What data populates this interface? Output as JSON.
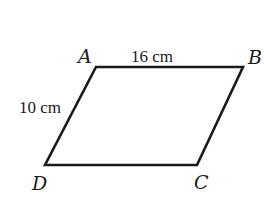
{
  "diagram": {
    "type": "parallelogram",
    "stroke_color": "#1a1a1a",
    "vertices": [
      {
        "name": "A",
        "x": 96,
        "y": 67,
        "label_x": 78,
        "label_y": 63
      },
      {
        "name": "B",
        "x": 243,
        "y": 67,
        "label_x": 248,
        "label_y": 64
      },
      {
        "name": "C",
        "x": 197,
        "y": 165,
        "label_x": 194,
        "label_y": 189
      },
      {
        "name": "D",
        "x": 45,
        "y": 165,
        "label_x": 32,
        "label_y": 190
      }
    ],
    "measurements": [
      {
        "side": "AB",
        "text": "16 cm",
        "x": 131,
        "y": 62
      },
      {
        "side": "AD",
        "text": "10 cm",
        "x": 19,
        "y": 113
      }
    ]
  }
}
